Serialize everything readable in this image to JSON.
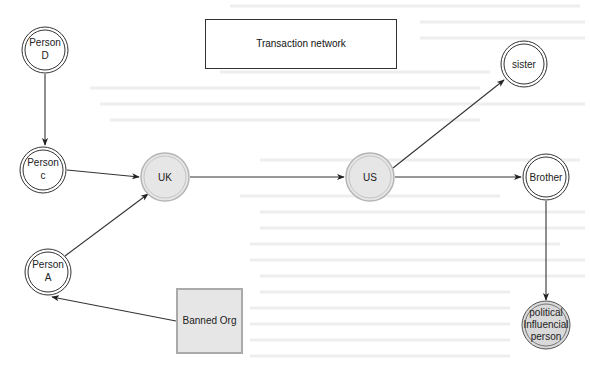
{
  "title": {
    "label": "Transaction network"
  },
  "nodes": [
    {
      "id": "person_d",
      "lines": [
        "Person",
        "D"
      ],
      "shape": "double-circle",
      "fill": "#ffffff"
    },
    {
      "id": "person_c",
      "lines": [
        "Person",
        "c"
      ],
      "shape": "double-circle",
      "fill": "#ffffff"
    },
    {
      "id": "person_a",
      "lines": [
        "Person",
        "A"
      ],
      "shape": "double-circle",
      "fill": "#ffffff"
    },
    {
      "id": "uk",
      "lines": [
        "UK"
      ],
      "shape": "double-circle",
      "fill": "#e6e6e6"
    },
    {
      "id": "us",
      "lines": [
        "US"
      ],
      "shape": "double-circle",
      "fill": "#e6e6e6"
    },
    {
      "id": "sister",
      "lines": [
        "sister"
      ],
      "shape": "double-circle",
      "fill": "#ffffff"
    },
    {
      "id": "brother",
      "lines": [
        "Brother"
      ],
      "shape": "double-circle",
      "fill": "#ffffff"
    },
    {
      "id": "political",
      "lines": [
        "political",
        "Influencial",
        "person"
      ],
      "shape": "double-circle",
      "fill": "#d9d9d9"
    },
    {
      "id": "banned_org",
      "lines": [
        "Banned Org"
      ],
      "shape": "square",
      "fill": "#e6e6e6"
    }
  ],
  "edges": [
    {
      "from": "Person D",
      "to": "Person c"
    },
    {
      "from": "Person c",
      "to": "UK"
    },
    {
      "from": "Person A",
      "to": "UK"
    },
    {
      "from": "Banned Org",
      "to": "Person A"
    },
    {
      "from": "UK",
      "to": "US"
    },
    {
      "from": "US",
      "to": "sister"
    },
    {
      "from": "US",
      "to": "Brother"
    },
    {
      "from": "Brother",
      "to": "political Influencial person"
    }
  ],
  "colors": {
    "stroke": "#333333",
    "country_fill": "#e6e6e6",
    "country_stroke": "#b0b0b0",
    "highlight_fill": "#d9d9d9"
  }
}
